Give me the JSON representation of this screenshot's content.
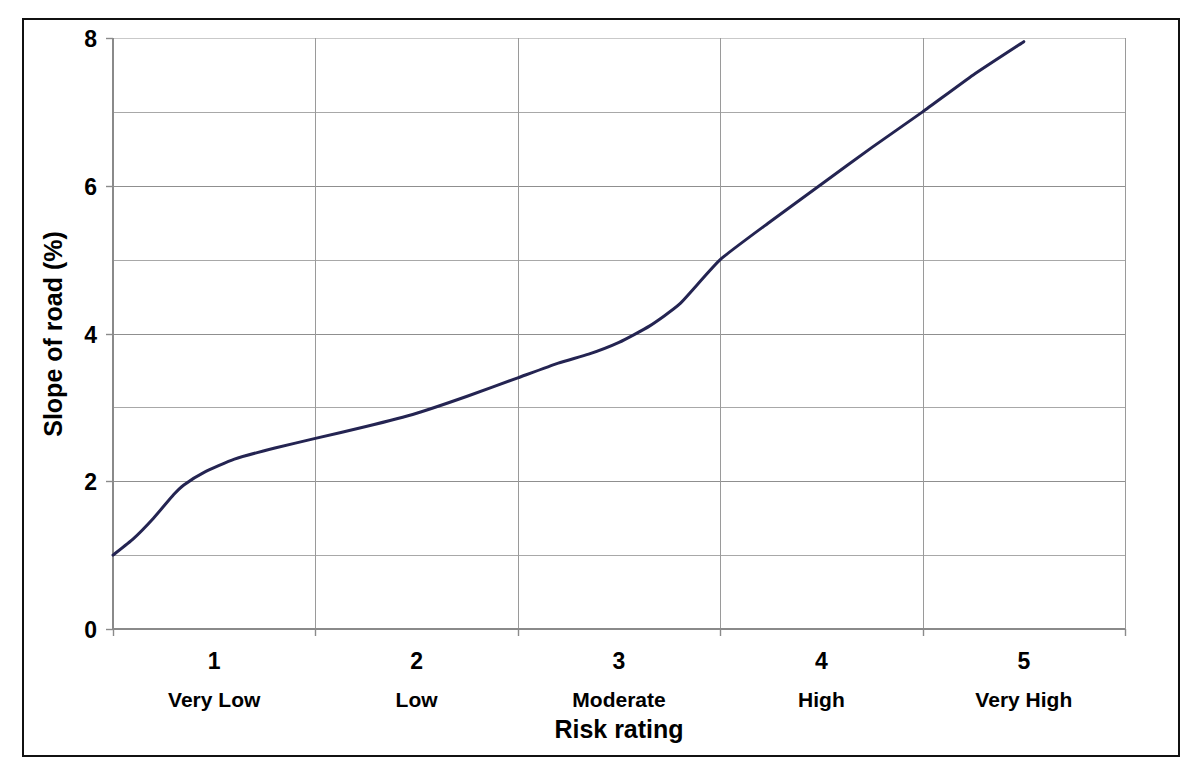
{
  "figure": {
    "border_color": "#111111",
    "background": "#ffffff"
  },
  "chart_data": {
    "type": "line",
    "title": "",
    "subtitle": "",
    "xlabel": "Risk rating",
    "ylabel": "Slope of road (%)",
    "xlim": [
      0.5,
      5.5
    ],
    "ylim": [
      0,
      8
    ],
    "grid": "both",
    "legend": "none",
    "line_color": "#242452",
    "line_width": 3,
    "y_ticks": [
      0,
      2,
      4,
      6,
      8
    ],
    "y_tick_labels": [
      "0",
      "2",
      "4",
      "6",
      "8"
    ],
    "y_minor_gridlines": [
      1,
      3,
      5,
      7
    ],
    "x_ticks": [
      1,
      2,
      3,
      4,
      5
    ],
    "x_tick_labels": [
      "1",
      "2",
      "3",
      "4",
      "5"
    ],
    "x_gridlines": [
      0.5,
      1.5,
      2.5,
      3.5,
      4.5,
      5.5
    ],
    "categories": [
      "Very Low",
      "Low",
      "Moderate",
      "High",
      "Very High"
    ],
    "category_values": [
      1,
      2,
      3,
      4,
      5
    ],
    "series": [
      {
        "name": "Slope of road",
        "x": [
          0.5,
          0.6,
          0.7,
          0.8,
          0.85,
          0.95,
          1.1,
          1.3,
          1.5,
          1.75,
          2.0,
          2.25,
          2.5,
          2.7,
          2.85,
          3.0,
          3.15,
          3.3,
          3.5,
          3.75,
          4.0,
          4.25,
          4.5,
          4.75,
          5.0
        ],
        "y": [
          1.0,
          1.22,
          1.5,
          1.82,
          1.95,
          2.12,
          2.3,
          2.45,
          2.58,
          2.74,
          2.92,
          3.15,
          3.4,
          3.6,
          3.72,
          3.88,
          4.1,
          4.4,
          5.0,
          5.52,
          6.02,
          6.52,
          7.0,
          7.5,
          7.95
        ]
      }
    ]
  },
  "axes": {
    "y_axis_label": "Slope of road (%)",
    "x_axis_label": "Risk rating"
  }
}
